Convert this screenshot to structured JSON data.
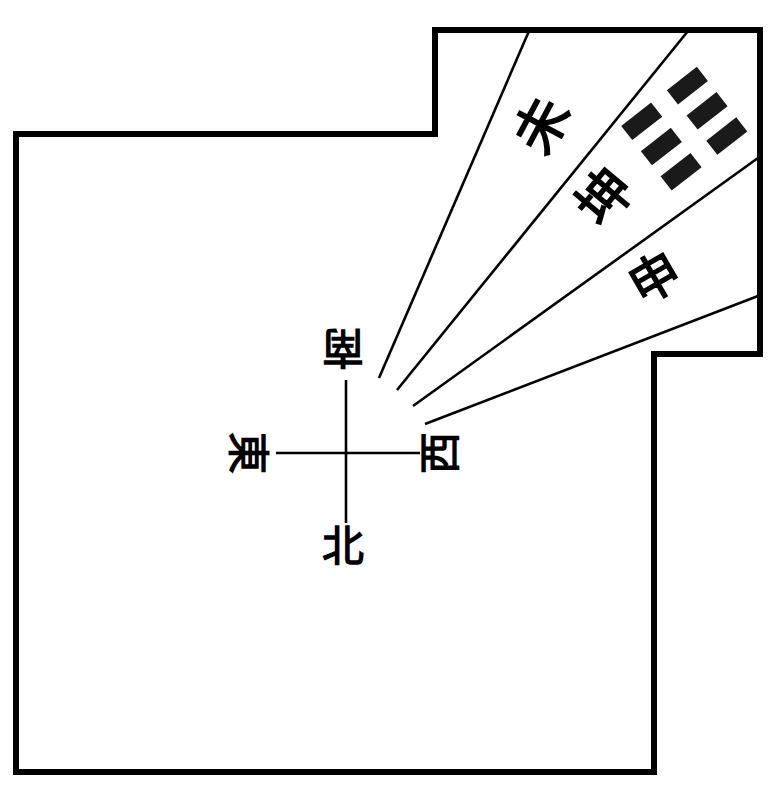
{
  "diagram": {
    "type": "compass-orientation-diagram",
    "colors": {
      "ink": "#000000",
      "paper": "#ffffff"
    },
    "compass": {
      "north": "北",
      "south": "南",
      "east": "東",
      "west": "西"
    },
    "sectors": [
      {
        "label": "未"
      },
      {
        "label": "坤",
        "trigram": "☷"
      },
      {
        "label": "申"
      }
    ]
  }
}
